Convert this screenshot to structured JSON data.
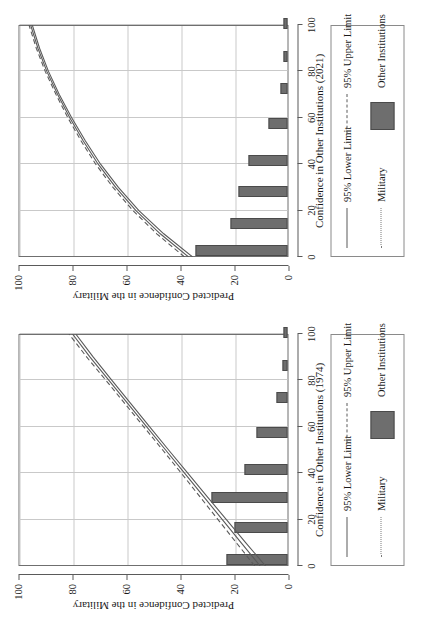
{
  "figure": {
    "panels": [
      {
        "id": "panel-1974",
        "xlabel": "Confidence in Other Institutions (1974)",
        "ylabel": "Predicted Confidence in the Military",
        "xticks": [
          "0",
          "20",
          "40",
          "60",
          "80",
          "100"
        ],
        "yticks": [
          "0",
          "20",
          "40",
          "60",
          "80",
          "100"
        ],
        "legend": {
          "lower_limit": "95% Lower Limit",
          "upper_limit": "95% Upper Limit",
          "military": "Military",
          "other": "Other Institutions"
        }
      },
      {
        "id": "panel-2021",
        "xlabel": "Confidence in Other Institutions (2021)",
        "ylabel": "Predicted Confidence in the Military",
        "xticks": [
          "0",
          "20",
          "40",
          "60",
          "80",
          "100"
        ],
        "yticks": [
          "0",
          "20",
          "40",
          "60",
          "80",
          "100"
        ],
        "legend": {
          "lower_limit": "95% Lower Limit",
          "upper_limit": "95% Upper Limit",
          "military": "Military",
          "other": "Other Institutions"
        }
      }
    ],
    "colors": {
      "bar_fill": "#6e6e6e",
      "bar_edge": "#4a4a4a",
      "line": "#5a5a5a",
      "grid": "#c9c9c9",
      "frame": "#6f6f6f"
    }
  },
  "chart_data": [
    {
      "type": "line",
      "id": "panel-1974",
      "title": "",
      "xlabel": "Confidence in Other Institutions (1974)",
      "ylabel": "Predicted Confidence in the Military",
      "xlim": [
        0,
        100
      ],
      "ylim": [
        0,
        100
      ],
      "xticks": [
        0,
        20,
        40,
        60,
        80,
        100
      ],
      "yticks": [
        0,
        20,
        40,
        60,
        80,
        100
      ],
      "grid": true,
      "legend_position": "below-plot",
      "series": [
        {
          "name": "Predicted (fit)",
          "style": "solid",
          "x": [
            0,
            10,
            20,
            30,
            40,
            50,
            60,
            70,
            80,
            90,
            100
          ],
          "y": [
            10.5,
            17.5,
            24.5,
            31.5,
            38.5,
            45.5,
            52.5,
            59.5,
            66.5,
            73.5,
            80.0
          ]
        },
        {
          "name": "95% Lower Limit",
          "style": "solid",
          "x": [
            0,
            10,
            20,
            30,
            40,
            50,
            60,
            70,
            80,
            90,
            100
          ],
          "y": [
            8.5,
            15.8,
            23.0,
            30.2,
            37.3,
            44.4,
            51.4,
            58.4,
            65.4,
            72.3,
            78.8
          ]
        },
        {
          "name": "95% Upper Limit",
          "style": "dashed",
          "x": [
            0,
            10,
            20,
            30,
            40,
            50,
            60,
            70,
            80,
            90,
            100
          ],
          "y": [
            12.5,
            19.3,
            26.1,
            32.9,
            39.7,
            46.6,
            53.6,
            60.6,
            67.6,
            74.7,
            81.3
          ]
        }
      ],
      "histogram": {
        "name": "Other Institutions",
        "bin_centers": [
          2,
          16,
          29,
          41,
          57,
          72,
          86,
          100
        ],
        "counts": [
          22.5,
          19.5,
          28.0,
          16.0,
          11.5,
          4.0,
          2.0,
          1.5
        ]
      }
    },
    {
      "type": "line",
      "id": "panel-2021",
      "title": "",
      "xlabel": "Confidence in Other Institutions (2021)",
      "ylabel": "Predicted Confidence in the Military",
      "xlim": [
        0,
        100
      ],
      "ylim": [
        0,
        100
      ],
      "xticks": [
        0,
        20,
        40,
        60,
        80,
        100
      ],
      "yticks": [
        0,
        20,
        40,
        60,
        80,
        100
      ],
      "grid": true,
      "legend_position": "below-plot",
      "series": [
        {
          "name": "Predicted (fit)",
          "style": "solid",
          "x": [
            0,
            10,
            20,
            30,
            40,
            50,
            60,
            70,
            80,
            90,
            100
          ],
          "y": [
            37.0,
            47.5,
            56.5,
            64.0,
            70.5,
            76.0,
            81.0,
            85.5,
            89.5,
            92.8,
            95.5
          ]
        },
        {
          "name": "95% Lower Limit",
          "style": "solid",
          "x": [
            0,
            10,
            20,
            30,
            40,
            50,
            60,
            70,
            80,
            90,
            100
          ],
          "y": [
            35.5,
            46.2,
            55.4,
            63.0,
            69.6,
            75.2,
            80.3,
            84.9,
            88.9,
            92.2,
            94.9
          ]
        },
        {
          "name": "95% Upper Limit",
          "style": "dashed",
          "x": [
            0,
            10,
            20,
            30,
            40,
            50,
            60,
            70,
            80,
            90,
            100
          ],
          "y": [
            38.5,
            48.8,
            57.6,
            65.0,
            71.4,
            76.8,
            81.7,
            86.1,
            90.1,
            93.4,
            96.1
          ]
        }
      ],
      "histogram": {
        "name": "Other Institutions",
        "bin_centers": [
          1,
          14,
          28,
          41,
          57,
          72,
          86,
          100
        ],
        "counts": [
          34.0,
          21.0,
          18.0,
          14.5,
          7.0,
          2.5,
          1.5,
          1.5
        ]
      }
    }
  ]
}
